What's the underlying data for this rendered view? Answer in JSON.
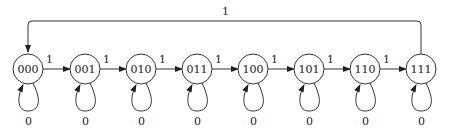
{
  "diagram": {
    "type": "state-machine",
    "states": [
      {
        "id": "000",
        "label": "000"
      },
      {
        "id": "001",
        "label": "001"
      },
      {
        "id": "010",
        "label": "010"
      },
      {
        "id": "011",
        "label": "011"
      },
      {
        "id": "100",
        "label": "100"
      },
      {
        "id": "101",
        "label": "101"
      },
      {
        "id": "110",
        "label": "110"
      },
      {
        "id": "111",
        "label": "111"
      }
    ],
    "transitions": [
      {
        "from": "000",
        "to": "001",
        "label": "1"
      },
      {
        "from": "001",
        "to": "010",
        "label": "1"
      },
      {
        "from": "010",
        "to": "011",
        "label": "1"
      },
      {
        "from": "011",
        "to": "100",
        "label": "1"
      },
      {
        "from": "100",
        "to": "101",
        "label": "1"
      },
      {
        "from": "101",
        "to": "110",
        "label": "1"
      },
      {
        "from": "110",
        "to": "111",
        "label": "1"
      },
      {
        "from": "111",
        "to": "000",
        "label": "1"
      }
    ],
    "self_loops": [
      {
        "state": "000",
        "label": "0"
      },
      {
        "state": "001",
        "label": "0"
      },
      {
        "state": "010",
        "label": "0"
      },
      {
        "state": "011",
        "label": "0"
      },
      {
        "state": "100",
        "label": "0"
      },
      {
        "state": "101",
        "label": "0"
      },
      {
        "state": "110",
        "label": "0"
      },
      {
        "state": "111",
        "label": "0"
      }
    ],
    "wrap_label": "1"
  }
}
